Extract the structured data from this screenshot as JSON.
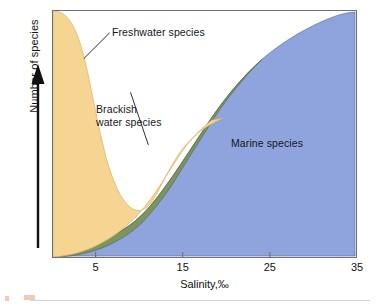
{
  "figure": {
    "kind": "scientific-area-chart"
  },
  "axes": {
    "y": {
      "label": "Number of species",
      "arrow_direction": "up",
      "ticks": []
    },
    "x": {
      "label": "Salinity,‰",
      "tick_labels": [
        "5",
        "15",
        "25",
        "35"
      ],
      "tick_values": [
        5,
        15,
        25,
        35
      ],
      "min": 0,
      "max": 35
    }
  },
  "annotations": [
    {
      "id": "freshwater",
      "text": "Freshwater species"
    },
    {
      "id": "brackish",
      "text": "Brackish water species"
    },
    {
      "id": "marine",
      "text": "Marine species"
    }
  ],
  "colors": {
    "freshwater": "#f5d591",
    "brackish": "#7d9461",
    "marine": "#8fa4dc",
    "frame": "#6d7278",
    "text": "#14161a",
    "background": "#ffffff"
  },
  "chart_data": {
    "type": "area",
    "title": "",
    "subtitle": "",
    "xlabel": "Salinity,‰",
    "ylabel": "Number of species",
    "xlim": [
      0,
      35
    ],
    "ylim": [
      0,
      100
    ],
    "grid": false,
    "legend": "inline-annotations",
    "x": [
      0,
      1,
      2,
      3,
      4,
      5,
      6,
      7,
      8,
      9,
      10,
      11,
      12,
      13,
      14,
      15,
      17,
      19,
      21,
      23,
      25,
      27,
      29,
      31,
      33,
      35
    ],
    "series": [
      {
        "name": "Freshwater species",
        "color": "#f5d591",
        "values": [
          100,
          96,
          88,
          74,
          56,
          38,
          23,
          13,
          9,
          8,
          8,
          7,
          6,
          5,
          4,
          3,
          2,
          1,
          0,
          0,
          0,
          0,
          0,
          0,
          0,
          0
        ]
      },
      {
        "name": "Brackish water species",
        "color": "#7d9461",
        "values": [
          2,
          3,
          4,
          5,
          6,
          7,
          8,
          9,
          10,
          10,
          9,
          8,
          7,
          6,
          5,
          4,
          3,
          2,
          1,
          1,
          0,
          0,
          0,
          0,
          0,
          0
        ]
      },
      {
        "name": "Marine species",
        "color": "#8fa4dc",
        "values": [
          0,
          1,
          2,
          4,
          6,
          8,
          11,
          14,
          18,
          22,
          27,
          32,
          37,
          42,
          47,
          52,
          60,
          67,
          73,
          79,
          84,
          88,
          92,
          95,
          98,
          100
        ]
      }
    ]
  }
}
